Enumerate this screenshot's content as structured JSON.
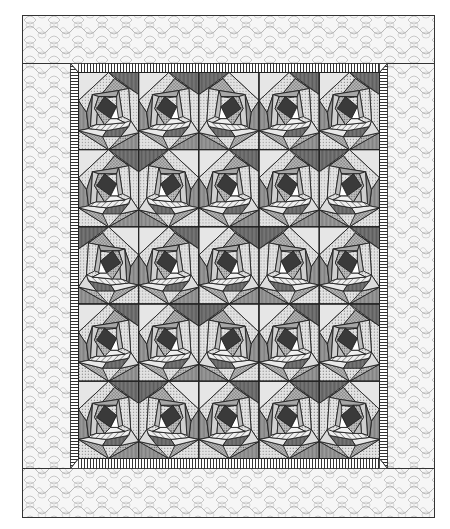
{
  "figure": {
    "layout": {
      "rows": 5,
      "columns": 5,
      "block_count": 25,
      "borders": [
        "piano-key stripe inner border",
        "wide stippled outer border"
      ]
    },
    "block": {
      "motif": "rose / spiral log-cabin block",
      "center": "dark diamond"
    },
    "colors": {
      "background": "#ffffff",
      "outline": "#222222",
      "diamond": "#3a3a3a",
      "dark": "#6e6e6e",
      "mid": "#9a9a9a",
      "light": "#c8c8c8",
      "pale": "#e6e6e6",
      "border_fill": "#f4f4f4",
      "border_scribble": "#9c9c9c",
      "stripe": "#333333"
    }
  }
}
